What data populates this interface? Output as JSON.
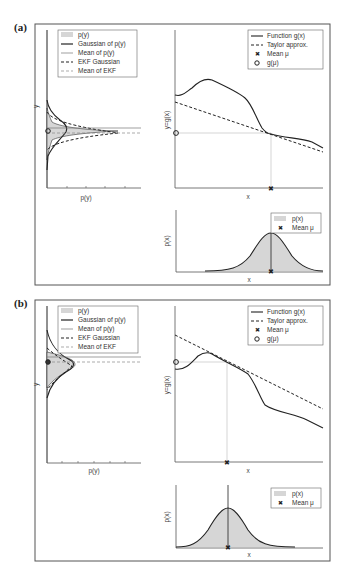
{
  "panels": [
    {
      "label": "(a)",
      "left_plot": {
        "xlabel": "p(y)",
        "ylabel": "y",
        "legend": [
          "p(y)",
          "Gaussian of p(y)",
          "Mean of p(y)",
          "EKF Gaussian",
          "Mean of EKF"
        ]
      },
      "top_right_plot": {
        "xlabel": "x",
        "ylabel": "y=g(x)",
        "legend": [
          "Function g(x)",
          "Taylor approx.",
          "Mean μ",
          "g(μ)"
        ]
      },
      "bottom_right_plot": {
        "xlabel": "x",
        "ylabel": "p(x)",
        "legend": [
          "p(x)",
          "Mean μ"
        ]
      }
    },
    {
      "label": "(b)",
      "left_plot": {
        "xlabel": "p(y)",
        "ylabel": "y",
        "legend": [
          "p(y)",
          "Gaussian of p(y)",
          "Mean of p(y)",
          "EKF Gaussian",
          "Mean of EKF"
        ]
      },
      "top_right_plot": {
        "xlabel": "x",
        "ylabel": "y=g(x)",
        "legend": [
          "Function g(x)",
          "Taylor approx.",
          "Mean μ",
          "g(μ)"
        ]
      },
      "bottom_right_plot": {
        "xlabel": "x",
        "ylabel": "p(x)",
        "legend": [
          "p(x)",
          "Mean μ"
        ]
      }
    }
  ],
  "colors": {
    "line": "#222222",
    "fill": "#d6d6d6",
    "frame": "#555555",
    "guide": "#bbbbbb"
  }
}
